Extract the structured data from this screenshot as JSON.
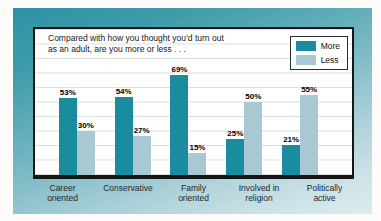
{
  "chart": {
    "title": "Compared with how you thought you’d turn out\nas an adult, are you more or less . . .",
    "legend": [
      {
        "label": "More",
        "color": "#1b8ca0"
      },
      {
        "label": "Less",
        "color": "#a9c9d2"
      }
    ],
    "groups": [
      {
        "category": "Career\noriented",
        "more": "53%",
        "less": "30%"
      },
      {
        "category": "Conservative",
        "more": "54%",
        "less": "27%"
      },
      {
        "category": "Family\noriented",
        "more": "69%",
        "less": "15%"
      },
      {
        "category": "Involved in\nreligion",
        "more": "25%",
        "less": "50%"
      },
      {
        "category": "Politically\nactive",
        "more": "21%",
        "less": "55%"
      }
    ],
    "background_gradient": [
      "#2e92a2",
      "#dcecee"
    ]
  },
  "chart_data": {
    "type": "bar",
    "title": "Compared with how you thought you’d turn out as an adult, are you more or less . . .",
    "categories": [
      "Career oriented",
      "Conservative",
      "Family oriented",
      "Involved in religion",
      "Politically active"
    ],
    "series": [
      {
        "name": "More",
        "color": "#1b8ca0",
        "values": [
          53,
          54,
          69,
          25,
          21
        ]
      },
      {
        "name": "Less",
        "color": "#a9c9d2",
        "values": [
          30,
          27,
          15,
          50,
          55
        ]
      }
    ],
    "unit": "%",
    "ylim": [
      0,
      100
    ],
    "grid": true,
    "legend_position": "top-right",
    "value_labels": true
  }
}
